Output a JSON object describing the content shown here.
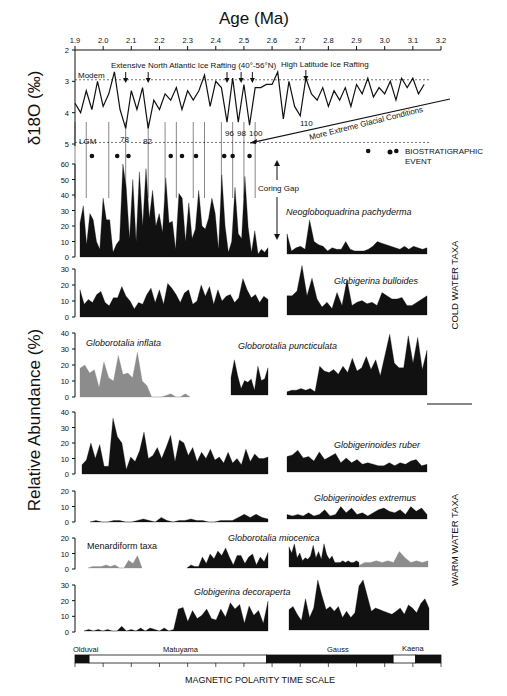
{
  "chart_data": {
    "type": "area",
    "title": "Age (Ma)",
    "x_axis": {
      "label": "Age (Ma)",
      "ticks": [
        "1.9",
        "2.0",
        "2.1",
        "2.2",
        "2.3",
        "2.4",
        "2.5",
        "2.6",
        "2.7",
        "2.8",
        "2.9",
        "3.0",
        "3.1",
        "3.2"
      ],
      "range": [
        1.9,
        3.2
      ]
    },
    "d18O_panel": {
      "ylabel": "δ18O (‰)",
      "yticks": [
        "2",
        "3",
        "4",
        "5"
      ],
      "ylim": [
        2,
        5
      ],
      "reference_lines": [
        {
          "label": "Modem",
          "value": 2.95
        },
        {
          "label": "LGM",
          "value": 4.95
        }
      ],
      "annotations": {
        "extensive": "Extensive North Atlantic Ice Rafting (40°-56°N)",
        "high_latitude": "High Latitude Ice Rafting",
        "extreme": "More Extreme Glacial Conditions",
        "stages": [
          "78",
          "82",
          "96",
          "98",
          "100",
          "110"
        ]
      },
      "series": [
        {
          "name": "δ18O",
          "x": [
            1.9,
            1.92,
            1.94,
            1.96,
            1.98,
            2.0,
            2.02,
            2.04,
            2.06,
            2.08,
            2.1,
            2.12,
            2.14,
            2.16,
            2.18,
            2.2,
            2.22,
            2.24,
            2.26,
            2.28,
            2.3,
            2.32,
            2.34,
            2.36,
            2.38,
            2.4,
            2.42,
            2.44,
            2.46,
            2.48,
            2.5,
            2.52,
            2.54,
            2.56,
            2.58,
            2.6,
            2.62,
            2.64,
            2.66,
            2.68,
            2.7,
            2.72,
            2.74,
            2.76,
            2.78,
            2.8,
            2.82,
            2.84,
            2.86,
            2.88,
            2.9,
            2.92,
            2.94,
            2.96,
            2.98,
            3.0,
            3.02,
            3.04,
            3.06,
            3.08,
            3.1,
            3.12,
            3.14
          ],
          "values": [
            3.7,
            4.0,
            3.3,
            3.9,
            3.0,
            3.8,
            3.4,
            2.7,
            3.9,
            4.5,
            3.3,
            3.9,
            3.2,
            4.5,
            3.6,
            3.9,
            3.4,
            3.6,
            3.2,
            3.9,
            3.3,
            3.6,
            3.3,
            2.8,
            3.8,
            3.0,
            3.2,
            4.3,
            2.9,
            4.3,
            3.1,
            4.4,
            3.2,
            3.2,
            3.1,
            3.1,
            2.7,
            4.2,
            3.0,
            3.8,
            4.1,
            2.9,
            3.4,
            3.6,
            3.2,
            3.8,
            3.3,
            3.6,
            3.2,
            3.8,
            3.1,
            3.4,
            2.9,
            3.5,
            3.2,
            3.4,
            3.0,
            3.6,
            2.9,
            3.2,
            2.9,
            3.4,
            3.1
          ]
        }
      ]
    },
    "legend": {
      "marker": "●",
      "label_line1": "BIOSTRATIGRAPHIC",
      "label_line2": "EVENT"
    },
    "coring_gap": "Coring Gap",
    "ylabel_main": "Relative Abundance (%)",
    "groups": [
      {
        "label": "COLD WATER TAXA",
        "taxa": [
          "Neogloboquadrina pachyderma",
          "Globigerina bulloides",
          "Globorotalia inflata",
          "Globorotalia puncticulata"
        ]
      },
      {
        "label": "WARM WATER TAXA",
        "taxa": [
          "Globigerinoides ruber",
          "Globigerinoides extremus",
          "Globorotalia miocenica",
          "Menardiform taxa",
          "Globigerina decoraperta"
        ]
      }
    ],
    "panels": [
      {
        "name": "Neogloboquadrina pachyderma",
        "yticks": [
          "0",
          "10",
          "20",
          "30",
          "40",
          "50",
          "60"
        ],
        "ylim": [
          0,
          60
        ],
        "left": [
          22,
          33,
          8,
          28,
          24,
          10,
          5,
          38,
          24,
          24,
          3,
          8,
          11,
          60,
          45,
          12,
          50,
          10,
          55,
          20,
          57,
          25,
          43,
          20,
          28,
          16,
          51,
          22,
          23,
          5,
          41,
          38,
          10,
          35,
          12,
          18,
          43,
          20,
          18,
          25,
          38,
          28,
          5,
          53,
          20,
          3,
          10,
          45,
          15,
          12,
          52,
          19,
          3,
          17,
          2,
          5,
          3,
          6
        ],
        "right": [
          13,
          2,
          4,
          5,
          3,
          22,
          8,
          6,
          5,
          2,
          4,
          3,
          3,
          8,
          3,
          2,
          2,
          2,
          3,
          5,
          8,
          7,
          6,
          5,
          4,
          3,
          5,
          3,
          5,
          4,
          3,
          4
        ]
      },
      {
        "name": "Globigerina bulloides",
        "yticks": [
          "0",
          "10",
          "20",
          "30"
        ],
        "ylim": [
          0,
          30
        ],
        "left": [
          17,
          8,
          11,
          9,
          14,
          16,
          9,
          7,
          12,
          12,
          19,
          13,
          10,
          5,
          9,
          8,
          14,
          18,
          9,
          17,
          8,
          21,
          18,
          14,
          9,
          15,
          17,
          8,
          10,
          20,
          13,
          19,
          8,
          17,
          10,
          13,
          14,
          9,
          12,
          24,
          17,
          12,
          14,
          9,
          13,
          11
        ],
        "right": [
          12,
          12,
          15,
          31,
          12,
          23,
          10,
          5,
          8,
          4,
          14,
          6,
          22,
          6,
          8,
          9,
          7,
          8,
          6,
          14,
          12,
          10,
          10,
          11,
          6,
          6,
          8,
          10,
          12
        ]
      },
      {
        "name": "Globorotalia inflata",
        "yticks": [
          "0",
          "10",
          "20",
          "30",
          "40"
        ],
        "ylim": [
          0,
          40
        ],
        "color": "#8c8c8c",
        "left": [
          18,
          20,
          15,
          17,
          6,
          22,
          12,
          10,
          26,
          14,
          15,
          12,
          28,
          10,
          7,
          0,
          0,
          0,
          1,
          2,
          0,
          0,
          2,
          0
        ],
        "right": []
      },
      {
        "name": "Globorotalia puncticulata",
        "yticks": [],
        "color": "#111111",
        "left": [
          11,
          22,
          12,
          4,
          9,
          8,
          10,
          3,
          18,
          9,
          10,
          17
        ],
        "right": [
          2,
          3,
          3,
          4,
          3,
          4,
          2,
          18,
          15,
          14,
          16,
          13,
          18,
          14,
          23,
          15,
          17,
          24,
          16,
          22,
          12,
          25,
          38,
          20,
          17,
          17,
          37,
          20,
          36,
          16,
          28
        ]
      },
      {
        "name": "Globigerinoides ruber",
        "yticks": [
          "0",
          "10",
          "20",
          "30",
          "40"
        ],
        "ylim": [
          0,
          40
        ],
        "left": [
          6,
          9,
          20,
          10,
          19,
          5,
          5,
          36,
          24,
          20,
          3,
          11,
          8,
          15,
          27,
          10,
          12,
          17,
          10,
          17,
          25,
          8,
          22,
          20,
          12,
          17,
          8,
          14,
          10,
          16,
          9,
          11,
          7,
          14,
          7,
          10,
          6,
          16,
          8,
          13,
          10,
          10,
          11
        ],
        "right": [
          10,
          11,
          14,
          9,
          10,
          7,
          13,
          8,
          10,
          12,
          6,
          9,
          6,
          8,
          5,
          6,
          5,
          4,
          4,
          6,
          4,
          6,
          5,
          7,
          8,
          4,
          5
        ]
      },
      {
        "name": "Globigerinoides extremus",
        "yticks": [
          "0",
          "10",
          "20"
        ],
        "ylim": [
          0,
          20
        ],
        "left": [
          0,
          1,
          0,
          0,
          1,
          1,
          0,
          0,
          1,
          2,
          1,
          0,
          3,
          1,
          0,
          1,
          1,
          2,
          1,
          1,
          0,
          0,
          1,
          1,
          1,
          3,
          5,
          3,
          5,
          3,
          2
        ],
        "right": [
          3,
          2,
          3,
          2,
          4,
          2,
          3,
          6,
          2,
          3,
          8,
          4,
          7,
          3,
          4,
          2,
          4,
          6,
          7,
          5,
          4,
          6,
          3,
          8,
          5,
          7,
          3
        ]
      },
      {
        "name": "Globorotalia miocenica",
        "yticks": [
          "0",
          "10",
          "20"
        ],
        "ylim": [
          0,
          20
        ],
        "left": [
          0,
          2,
          1,
          1,
          7,
          3,
          9,
          6,
          11,
          8,
          13,
          7,
          2,
          8,
          8,
          3,
          7,
          9,
          2,
          7,
          4,
          10
        ],
        "right": [
          13,
          9,
          15,
          6,
          9,
          4,
          6,
          5,
          7,
          14,
          6,
          10,
          5,
          15,
          8,
          5,
          7,
          3,
          3,
          3,
          4,
          3,
          4,
          3,
          3,
          4,
          3
        ]
      },
      {
        "name": "Menardiform taxa",
        "color": "#8c8c8c",
        "left": [
          0,
          1,
          1,
          1,
          2,
          1,
          2,
          0,
          0,
          5,
          3,
          8,
          0
        ],
        "right": [
          0,
          0,
          0,
          0,
          0,
          0,
          0,
          0,
          0,
          0,
          0,
          0,
          0,
          0,
          1,
          3,
          3,
          4,
          3,
          4,
          3,
          10,
          6,
          3,
          4,
          3,
          4
        ]
      },
      {
        "name": "Globigerina decoraperta",
        "yticks": [
          "0",
          "10",
          "20",
          "30"
        ],
        "ylim": [
          0,
          30
        ],
        "left": [
          0,
          1,
          0,
          1,
          0,
          1,
          0,
          0,
          3,
          0,
          1,
          0,
          2,
          0,
          2,
          1,
          0,
          2,
          0,
          1,
          14,
          15,
          6,
          13,
          8,
          10,
          14,
          8,
          7,
          14,
          9,
          18,
          14,
          17,
          5,
          16,
          10,
          13,
          5,
          19
        ],
        "right": [
          13,
          15,
          10,
          6,
          20,
          8,
          14,
          32,
          22,
          13,
          15,
          12,
          15,
          8,
          12,
          8,
          11,
          28,
          32,
          22,
          12,
          14,
          13,
          12,
          11,
          10,
          12,
          14,
          10,
          16,
          14,
          11,
          17,
          20,
          14
        ]
      }
    ],
    "polarity": {
      "title": "MAGNETIC POLARITY TIME SCALE",
      "labels": [
        "Olduvai",
        "Matuyama",
        "Gauss",
        "Kaena"
      ],
      "blocks": [
        {
          "from": 1.9,
          "to": 1.95,
          "fill": "black"
        },
        {
          "from": 1.95,
          "to": 2.58,
          "fill": "white"
        },
        {
          "from": 2.58,
          "to": 3.03,
          "fill": "black"
        },
        {
          "from": 3.03,
          "to": 3.11,
          "fill": "white"
        },
        {
          "from": 3.11,
          "to": 3.2,
          "fill": "black"
        }
      ]
    }
  },
  "text": {
    "age_title": "Age (Ma)",
    "d18o_label": "δ18O (‰)",
    "modem": "Modem",
    "lgm": "LGM",
    "extensive": "Extensive North Atlantic Ice Rafting (40°-56°N)",
    "high_lat": "High Latitude Ice Rafting",
    "extreme": "More Extreme Glacial Conditions",
    "s78": "78",
    "s82": "82",
    "s96": "96",
    "s98": "98",
    "s100": "100",
    "s110": "110",
    "bio1": "BIOSTRATIGRAPHIC",
    "bio2": "EVENT",
    "coring_gap": "Coring Gap",
    "rel_ab": "Relative Abundance (%)",
    "cold": "COLD WATER TAXA",
    "warm": "WARM  WATER TAXA",
    "pach": "Neogloboquadrina  pachyderma",
    "bull": "Globigerina  bulloides",
    "infl": "Globorotalia  inflata",
    "punc": "Globorotalia  puncticulata",
    "ruber": "Globigerinoides  ruber",
    "extr": "Globigerinoides  extremus",
    "mioc": "Globorotalia  miocenica",
    "menard": "Menardiform taxa",
    "decor": "Globigerina  decoraperta",
    "olduvai": "Olduvai",
    "matuyama": "Matuyama",
    "gauss": "Gauss",
    "kaena": "Kaena",
    "mpts": "MAGNETIC POLARITY TIME SCALE"
  }
}
